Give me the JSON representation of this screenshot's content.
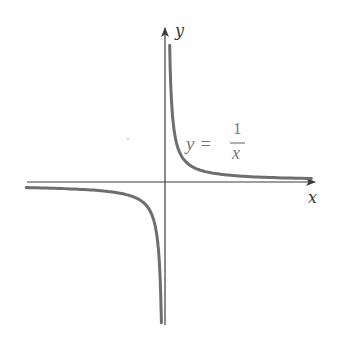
{
  "chart_data": {
    "type": "line",
    "title": "",
    "function": "y = 1/x",
    "xlabel": "x",
    "ylabel": "y",
    "annotation": {
      "lhs": "y =",
      "numerator": "1",
      "denominator": "x"
    },
    "grid": false,
    "ticks": false,
    "legend": null,
    "xlim": [
      -7.2,
      7.8
    ],
    "ylim": [
      -7.4,
      7.0
    ],
    "series": [
      {
        "name": "y = 1/x (x > 0)",
        "x": [
          0.14,
          0.2,
          0.3,
          0.5,
          0.75,
          1,
          1.5,
          2,
          3,
          4,
          5,
          6,
          7.5
        ],
        "y": [
          7.0,
          5.0,
          3.33,
          2.0,
          1.33,
          1.0,
          0.67,
          0.5,
          0.33,
          0.25,
          0.2,
          0.17,
          0.13
        ]
      },
      {
        "name": "y = 1/x (x < 0)",
        "x": [
          -7.2,
          -6,
          -5,
          -4,
          -3,
          -2,
          -1.5,
          -1,
          -0.75,
          -0.5,
          -0.3,
          -0.2,
          -0.14
        ],
        "y": [
          -0.14,
          -0.17,
          -0.2,
          -0.25,
          -0.33,
          -0.5,
          -0.67,
          -1.0,
          -1.33,
          -2.0,
          -3.33,
          -5.0,
          -7.2
        ]
      }
    ],
    "colors": {
      "curve": "#6e6e6e",
      "axes": "#3c3c3c",
      "annotation": "#7a7a7a"
    }
  }
}
